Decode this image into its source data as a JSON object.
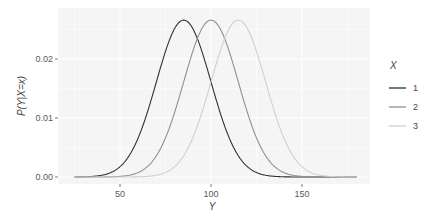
{
  "chart_data": {
    "type": "line",
    "title": "",
    "xlabel": "Y",
    "ylabel": "P(Y|X=x)",
    "xlim": [
      17,
      188
    ],
    "ylim": [
      -0.0012,
      0.0287
    ],
    "x_ticks": [
      50,
      100,
      150
    ],
    "x_tick_labels": [
      "50",
      "100",
      "150"
    ],
    "y_ticks": [
      0.0,
      0.01,
      0.02
    ],
    "y_tick_labels": [
      "0.00",
      "0.01",
      "0.02"
    ],
    "x_range": [
      25,
      180
    ],
    "grid": true,
    "legend_position": "right",
    "legend": {
      "title": "X",
      "entries": [
        "1",
        "2",
        "3"
      ]
    },
    "series": [
      {
        "name": "1",
        "distribution": "normal",
        "mean": 85,
        "sd": 15,
        "peak": 0.0266,
        "color": "#303030"
      },
      {
        "name": "2",
        "distribution": "normal",
        "mean": 100,
        "sd": 15,
        "peak": 0.0266,
        "color": "#8f8f8f"
      },
      {
        "name": "3",
        "distribution": "normal",
        "mean": 115,
        "sd": 15,
        "peak": 0.0266,
        "color": "#cfcfcf"
      }
    ]
  },
  "colors": {
    "panel_bg": "#f5f5f5",
    "grid": "#ffffff",
    "text": "#5a5a5a"
  }
}
